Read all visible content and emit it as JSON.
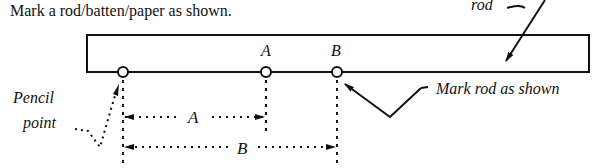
{
  "caption": "Mark a rod/batten/paper as shown.",
  "labels": {
    "rod": "rod",
    "mark_a": "A",
    "mark_b": "B",
    "dim_a": "A",
    "dim_b": "B",
    "mark_rod": "Mark rod as shown",
    "pencil_line1": "Pencil",
    "pencil_line2": "point"
  },
  "colors": {
    "ink": "#111111",
    "background": "#ffffff"
  }
}
